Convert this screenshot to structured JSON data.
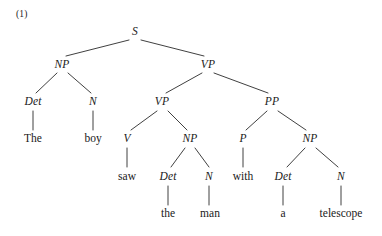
{
  "figure": {
    "example_number": "(1)",
    "sentence": "The boy saw the man with a telescope",
    "diagram_type": "syntax-tree"
  },
  "nodes": {
    "s": {
      "label": "S",
      "x": 135,
      "y": 32,
      "kind": "category"
    },
    "np_subject": {
      "label": "NP",
      "x": 62,
      "y": 65,
      "kind": "category"
    },
    "vp_top": {
      "label": "VP",
      "x": 208,
      "y": 65,
      "kind": "category"
    },
    "det_1": {
      "label": "Det",
      "x": 33,
      "y": 102,
      "kind": "category"
    },
    "n_1": {
      "label": "N",
      "x": 93,
      "y": 102,
      "kind": "category"
    },
    "vp_inner": {
      "label": "VP",
      "x": 162,
      "y": 102,
      "kind": "category"
    },
    "pp": {
      "label": "PP",
      "x": 272,
      "y": 102,
      "kind": "category"
    },
    "word_the_1": {
      "label": "The",
      "x": 33,
      "y": 139,
      "kind": "word"
    },
    "word_boy": {
      "label": "boy",
      "x": 93,
      "y": 139,
      "kind": "word"
    },
    "v": {
      "label": "V",
      "x": 127,
      "y": 139,
      "kind": "category"
    },
    "np_object": {
      "label": "NP",
      "x": 190,
      "y": 139,
      "kind": "category"
    },
    "p": {
      "label": "P",
      "x": 243,
      "y": 139,
      "kind": "category"
    },
    "np_pp": {
      "label": "NP",
      "x": 310,
      "y": 139,
      "kind": "category"
    },
    "word_saw": {
      "label": "saw",
      "x": 127,
      "y": 177,
      "kind": "word"
    },
    "det_2": {
      "label": "Det",
      "x": 168,
      "y": 177,
      "kind": "category"
    },
    "n_2": {
      "label": "N",
      "x": 209,
      "y": 177,
      "kind": "category"
    },
    "word_with": {
      "label": "with",
      "x": 243,
      "y": 177,
      "kind": "word"
    },
    "det_3": {
      "label": "Det",
      "x": 283,
      "y": 177,
      "kind": "category"
    },
    "n_3": {
      "label": "N",
      "x": 341,
      "y": 177,
      "kind": "category"
    },
    "word_the_2": {
      "label": "the",
      "x": 168,
      "y": 214,
      "kind": "word"
    },
    "word_man": {
      "label": "man",
      "x": 210,
      "y": 214,
      "kind": "word"
    },
    "word_a": {
      "label": "a",
      "x": 283,
      "y": 214,
      "kind": "word"
    },
    "word_telescope": {
      "label": "telescope",
      "x": 341,
      "y": 214,
      "kind": "word"
    }
  },
  "edges": [
    {
      "from": "s",
      "to": "np_subject",
      "x1": 129,
      "y1": 40,
      "x2": 66,
      "y2": 56
    },
    {
      "from": "s",
      "to": "vp_top",
      "x1": 141,
      "y1": 40,
      "x2": 204,
      "y2": 56
    },
    {
      "from": "np_subject",
      "to": "det_1",
      "x1": 57,
      "y1": 73,
      "x2": 36,
      "y2": 93
    },
    {
      "from": "np_subject",
      "to": "n_1",
      "x1": 68,
      "y1": 73,
      "x2": 91,
      "y2": 93
    },
    {
      "from": "vp_top",
      "to": "vp_inner",
      "x1": 202,
      "y1": 73,
      "x2": 166,
      "y2": 93
    },
    {
      "from": "vp_top",
      "to": "pp",
      "x1": 214,
      "y1": 73,
      "x2": 268,
      "y2": 93
    },
    {
      "from": "det_1",
      "to": "word_the_1",
      "x1": 33,
      "y1": 111,
      "x2": 33,
      "y2": 130
    },
    {
      "from": "n_1",
      "to": "word_boy",
      "x1": 93,
      "y1": 111,
      "x2": 93,
      "y2": 130
    },
    {
      "from": "vp_inner",
      "to": "v",
      "x1": 157,
      "y1": 111,
      "x2": 131,
      "y2": 130
    },
    {
      "from": "vp_inner",
      "to": "np_object",
      "x1": 168,
      "y1": 111,
      "x2": 187,
      "y2": 130
    },
    {
      "from": "pp",
      "to": "p",
      "x1": 267,
      "y1": 111,
      "x2": 246,
      "y2": 130
    },
    {
      "from": "pp",
      "to": "np_pp",
      "x1": 278,
      "y1": 111,
      "x2": 306,
      "y2": 130
    },
    {
      "from": "v",
      "to": "word_saw",
      "x1": 127,
      "y1": 148,
      "x2": 127,
      "y2": 167
    },
    {
      "from": "np_object",
      "to": "det_2",
      "x1": 185,
      "y1": 148,
      "x2": 171,
      "y2": 167
    },
    {
      "from": "np_object",
      "to": "n_2",
      "x1": 195,
      "y1": 148,
      "x2": 209,
      "y2": 167
    },
    {
      "from": "p",
      "to": "word_with",
      "x1": 243,
      "y1": 148,
      "x2": 243,
      "y2": 167
    },
    {
      "from": "np_pp",
      "to": "det_3",
      "x1": 305,
      "y1": 148,
      "x2": 287,
      "y2": 167
    },
    {
      "from": "np_pp",
      "to": "n_3",
      "x1": 316,
      "y1": 148,
      "x2": 338,
      "y2": 167
    },
    {
      "from": "det_2",
      "to": "word_the_2",
      "x1": 168,
      "y1": 186,
      "x2": 168,
      "y2": 205
    },
    {
      "from": "n_2",
      "to": "word_man",
      "x1": 209,
      "y1": 186,
      "x2": 209,
      "y2": 205
    },
    {
      "from": "det_3",
      "to": "word_a",
      "x1": 283,
      "y1": 186,
      "x2": 283,
      "y2": 205
    },
    {
      "from": "n_3",
      "to": "word_telescope",
      "x1": 341,
      "y1": 186,
      "x2": 341,
      "y2": 205
    }
  ],
  "style": {
    "line_color": "#2a2a2a",
    "text_color": "#1a1a1a",
    "background": "#ffffff"
  }
}
